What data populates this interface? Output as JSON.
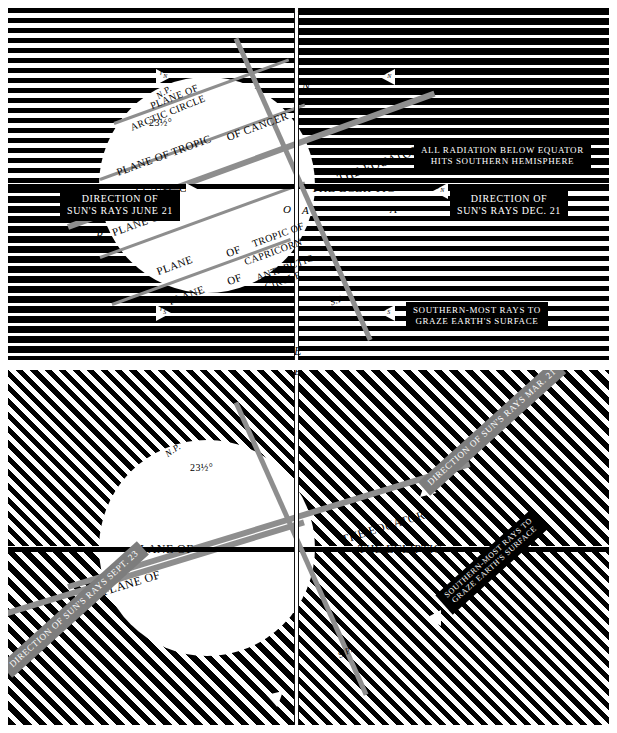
{
  "figure": {
    "colors": {
      "ink": "#000000",
      "paper": "#ffffff",
      "ray_band": "#8e8e8e",
      "plaque_bg": "#000000"
    }
  },
  "panels": [
    {
      "id": "solstice",
      "name": "June 21 / Dec. 21 solstice panel",
      "axis_labels": {
        "top": "P",
        "north_pole": "N",
        "south_pole": "S.P.",
        "bottom": "E",
        "left": "B",
        "right": "A",
        "np_marker": "N.P."
      },
      "tilt_angle": "23½°",
      "disc_labels": [
        "PLANE OF",
        "ARCTIC CIRCLE",
        "PLANE OF TROPIC",
        "OF CANCER",
        "THE EQUATOR",
        "PLANE OF",
        "THE ECLIPTIC",
        "PLANE OF",
        "PLANE",
        "OF",
        "TROPIC OF",
        "CAPRICORN",
        "PLANE",
        "OF",
        "ANTARCTIC",
        "CIRCLE"
      ],
      "plaques": [
        {
          "id": "left-rays",
          "lines": [
            "DIRECTION OF",
            "SUN'S RAYS JUNE 21"
          ]
        },
        {
          "id": "right-rays",
          "lines": [
            "DIRECTION OF",
            "SUN'S RAYS DEC. 21"
          ]
        },
        {
          "id": "radiation-note",
          "lines": [
            "ALL RADIATION BELOW EQUATOR",
            "HITS SOUTHERN HEMISPHERE"
          ]
        },
        {
          "id": "grazing-note",
          "lines": [
            "SOUTHERN-MOST RAYS TO",
            "GRAZE EARTH'S SURFACE"
          ]
        }
      ],
      "ray_markers": [
        "rN",
        "rN",
        "rS",
        "rS",
        "rN",
        "rS"
      ]
    },
    {
      "id": "equinox",
      "name": "Mar. 21 / Sept. 23 equinox panel",
      "axis_labels": {
        "top": "E",
        "north_pole": "N.P.",
        "south_pole": "S.P."
      },
      "tilt_angle": "23½°",
      "disc_labels": [
        "THE EQUATOR",
        "PLANE OF",
        "THE ECLIPTIC",
        "PLANE OF"
      ],
      "plaques": [
        {
          "id": "mar-rays",
          "lines": [
            "DIRECTION OF SUN'S RAYS MAR. 21"
          ]
        },
        {
          "id": "sept-rays",
          "lines": [
            "DIRECTION OF SUN'S RAYS SEPT. 23"
          ]
        },
        {
          "id": "grazing-note",
          "lines": [
            "SOUTHERN-MOST RAYS TO",
            "GRAZE EARTH'S SURFACE"
          ]
        }
      ]
    }
  ]
}
